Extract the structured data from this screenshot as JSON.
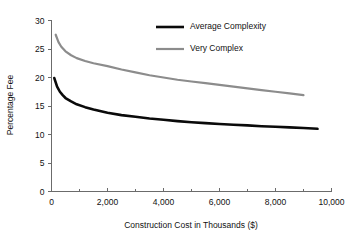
{
  "chart_data": {
    "type": "line",
    "title": "",
    "xlabel": "Construction Cost in Thousands ($)",
    "ylabel": "Percentage Fee",
    "xlim": [
      0,
      10000
    ],
    "ylim": [
      0,
      30
    ],
    "grid": false,
    "legend_position": "top-right",
    "xticks": [
      0,
      2000,
      4000,
      6000,
      8000,
      10000
    ],
    "xticklabels": [
      "0",
      "2,000",
      "4,000",
      "6,000",
      "8,000",
      "10,000"
    ],
    "xminor_ticks": [
      1000,
      3000,
      5000,
      7000,
      9000
    ],
    "yticks": [
      0,
      5,
      10,
      15,
      20,
      25,
      30
    ],
    "yticklabels": [
      "0",
      "5",
      "10",
      "15",
      "20",
      "25",
      "30"
    ],
    "series": [
      {
        "name": "Average Complexity",
        "color": "#0a0a0a",
        "line_width": 2.6,
        "x": [
          100,
          200,
          300,
          400,
          500,
          700,
          900,
          1200,
          1500,
          2000,
          2500,
          3000,
          3500,
          4000,
          4500,
          5000,
          5500,
          6000,
          6500,
          7000,
          7500,
          8000,
          8500,
          9000,
          9500
        ],
        "y": [
          19.9,
          18.4,
          17.5,
          16.9,
          16.4,
          15.8,
          15.3,
          14.8,
          14.4,
          13.8,
          13.4,
          13.1,
          12.8,
          12.6,
          12.35,
          12.15,
          12.0,
          11.85,
          11.7,
          11.6,
          11.45,
          11.35,
          11.25,
          11.15,
          11.0
        ]
      },
      {
        "name": "Very Complex",
        "color": "#8c8c8c",
        "line_width": 2.2,
        "x": [
          150,
          250,
          350,
          500,
          700,
          900,
          1200,
          1500,
          2000,
          2500,
          3000,
          3500,
          4000,
          4500,
          5000,
          5500,
          6000,
          6500,
          7000,
          7500,
          8000,
          8500,
          9000
        ],
        "y": [
          27.5,
          26.2,
          25.4,
          24.6,
          23.9,
          23.4,
          22.9,
          22.5,
          22.0,
          21.4,
          20.9,
          20.4,
          20.0,
          19.6,
          19.3,
          19.0,
          18.7,
          18.4,
          18.1,
          17.8,
          17.5,
          17.2,
          16.9
        ]
      }
    ],
    "legend": [
      {
        "label": "Average Complexity",
        "color": "#0a0a0a"
      },
      {
        "label": "Very Complex",
        "color": "#8c8c8c"
      }
    ]
  }
}
